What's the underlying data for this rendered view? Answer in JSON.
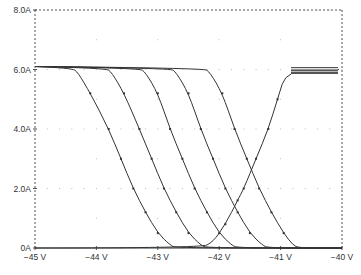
{
  "chart_data": {
    "type": "line",
    "title": "",
    "xlabel": "",
    "ylabel": "",
    "xlim": [
      -45,
      -40
    ],
    "ylim": [
      0,
      8
    ],
    "x_ticks": [
      "-45 V",
      "-44 V",
      "-43 V",
      "-42 V",
      "-41 V",
      "-40 V"
    ],
    "x_tick_values": [
      -45,
      -44,
      -43,
      -42,
      -41,
      -40
    ],
    "y_ticks": [
      "0A",
      "2.0A",
      "4.0A",
      "6.0A",
      "8.0A"
    ],
    "y_tick_values": [
      0,
      2,
      4,
      6,
      8
    ],
    "grid": "dotted",
    "legend": "small overlapping marker legend at top-right (illegible)",
    "series": [
      {
        "name": "falling-1",
        "points": [
          [
            -45,
            6.1
          ],
          [
            -44.4,
            6.05
          ],
          [
            -44.3,
            5.9
          ],
          [
            -44.1,
            5.2
          ],
          [
            -43.8,
            4.0
          ],
          [
            -43.6,
            3.0
          ],
          [
            -43.4,
            2.0
          ],
          [
            -43.2,
            1.2
          ],
          [
            -43.0,
            0.5
          ],
          [
            -42.8,
            0.1
          ],
          [
            -42.7,
            0.0
          ],
          [
            -40,
            0.0
          ]
        ]
      },
      {
        "name": "falling-2",
        "points": [
          [
            -45,
            6.1
          ],
          [
            -43.85,
            6.05
          ],
          [
            -43.75,
            5.9
          ],
          [
            -43.55,
            5.2
          ],
          [
            -43.3,
            4.0
          ],
          [
            -43.1,
            3.0
          ],
          [
            -42.9,
            2.0
          ],
          [
            -42.7,
            1.2
          ],
          [
            -42.5,
            0.5
          ],
          [
            -42.3,
            0.1
          ],
          [
            -42.2,
            0.0
          ],
          [
            -40,
            0.0
          ]
        ]
      },
      {
        "name": "falling-3",
        "points": [
          [
            -45,
            6.1
          ],
          [
            -43.3,
            6.05
          ],
          [
            -43.2,
            5.9
          ],
          [
            -43.0,
            5.2
          ],
          [
            -42.8,
            4.0
          ],
          [
            -42.6,
            3.0
          ],
          [
            -42.4,
            2.0
          ],
          [
            -42.2,
            1.2
          ],
          [
            -42.0,
            0.5
          ],
          [
            -41.8,
            0.1
          ],
          [
            -41.7,
            0.0
          ],
          [
            -40,
            0.0
          ]
        ]
      },
      {
        "name": "falling-4",
        "points": [
          [
            -45,
            6.1
          ],
          [
            -42.8,
            6.05
          ],
          [
            -42.7,
            5.9
          ],
          [
            -42.5,
            5.2
          ],
          [
            -42.3,
            4.0
          ],
          [
            -42.1,
            3.0
          ],
          [
            -41.9,
            2.0
          ],
          [
            -41.7,
            1.2
          ],
          [
            -41.5,
            0.5
          ],
          [
            -41.3,
            0.1
          ],
          [
            -41.2,
            0.0
          ],
          [
            -40,
            0.0
          ]
        ]
      },
      {
        "name": "falling-5",
        "points": [
          [
            -45,
            6.1
          ],
          [
            -42.25,
            6.05
          ],
          [
            -42.15,
            5.9
          ],
          [
            -41.95,
            5.2
          ],
          [
            -41.75,
            4.0
          ],
          [
            -41.55,
            3.0
          ],
          [
            -41.35,
            2.0
          ],
          [
            -41.15,
            1.2
          ],
          [
            -40.95,
            0.5
          ],
          [
            -40.8,
            0.1
          ],
          [
            -40.7,
            0.0
          ],
          [
            -40,
            0.0
          ]
        ]
      },
      {
        "name": "rising",
        "points": [
          [
            -45,
            0.0
          ],
          [
            -42.3,
            0.0
          ],
          [
            -42.1,
            0.2
          ],
          [
            -41.9,
            0.8
          ],
          [
            -41.7,
            1.6
          ],
          [
            -41.6,
            2.0
          ],
          [
            -41.4,
            3.0
          ],
          [
            -41.2,
            4.0
          ],
          [
            -41.05,
            5.0
          ],
          [
            -40.9,
            6.0
          ],
          [
            -40.05,
            6.0
          ]
        ]
      }
    ]
  },
  "axes": {
    "x_labels": [
      "−45 V",
      "−44 V",
      "−43 V",
      "−42 V",
      "−41 V",
      "−40 V"
    ],
    "y_labels": [
      "0A",
      "2.0A",
      "4.0A",
      "6.0A",
      "8.0A"
    ]
  },
  "style": {
    "line_color": "#333333",
    "axis_color": "#555555",
    "grid_color": "#bbbbbb",
    "background": "#ffffff"
  }
}
